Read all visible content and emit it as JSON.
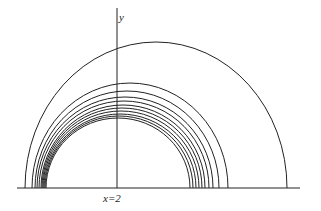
{
  "figure": {
    "y_axis_label": "y",
    "x_marker_label": "x=2",
    "line_color": "#222222",
    "background": "#ffffff"
  },
  "diagram": {
    "type": "nested semicircular curves above a horizontal baseline",
    "baseline": {
      "x1": 17,
      "x2": 300,
      "y": 188
    },
    "vertical_axis": {
      "x": 117,
      "y1": 8,
      "y2": 188
    },
    "arcs": [
      {
        "cx": 156,
        "rx": 131,
        "ry": 146
      },
      {
        "cx": 130,
        "rx": 98,
        "ry": 105
      },
      {
        "cx": 127,
        "rx": 92,
        "ry": 97
      },
      {
        "cx": 125,
        "rx": 88,
        "ry": 91
      },
      {
        "cx": 124,
        "rx": 85,
        "ry": 87
      },
      {
        "cx": 123,
        "rx": 82,
        "ry": 83
      },
      {
        "cx": 122,
        "rx": 80,
        "ry": 80
      },
      {
        "cx": 121,
        "rx": 78,
        "ry": 77
      },
      {
        "cx": 120,
        "rx": 76,
        "ry": 74
      },
      {
        "cx": 119,
        "rx": 74,
        "ry": 72
      },
      {
        "cx": 118,
        "rx": 72,
        "ry": 70
      }
    ]
  }
}
